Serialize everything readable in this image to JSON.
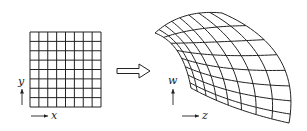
{
  "diagram": {
    "left_panel": {
      "grid": {
        "x": 30,
        "y": 32,
        "width": 71,
        "height": 75,
        "cols": 8,
        "rows": 8
      },
      "axis_labels": {
        "vertical": "y",
        "horizontal": "x"
      }
    },
    "mapping_arrow": {
      "style": "double-line",
      "x1": 117,
      "x2": 150,
      "y": 71
    },
    "right_panel": {
      "grid": {
        "cols": 8,
        "rows": 8,
        "corners": {
          "top_left": [
            155,
            33
          ],
          "top_right": [
            222,
            13
          ],
          "bottom_left": [
            191,
            88
          ],
          "bottom_right": [
            289,
            123
          ]
        },
        "edge_midpoints": {
          "top": [
            185,
            16
          ],
          "bottom": [
            236,
            108
          ],
          "left": [
            178,
            52
          ],
          "right": [
            279,
            58
          ]
        },
        "center": [
          222,
          58
        ]
      },
      "axis_labels": {
        "vertical": "w",
        "horizontal": "z"
      }
    },
    "stroke_color": "#222222",
    "background": "#ffffff"
  }
}
